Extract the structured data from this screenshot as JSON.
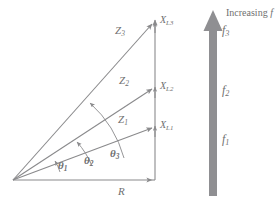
{
  "figure": {
    "colors": {
      "stroke": "#8a8a8c",
      "text": "#6f6f70",
      "arrow_fill": "#8f8f92",
      "background": "#ffffff"
    },
    "vectors": [
      {
        "name": "Z1",
        "base": "Z",
        "sub": "1",
        "label_x": 118,
        "label_y": 114,
        "angle_deg": 20
      },
      {
        "name": "Z2",
        "base": "Z",
        "sub": "2",
        "label_x": 119,
        "label_y": 75,
        "angle_deg": 37
      },
      {
        "name": "Z3",
        "base": "Z",
        "sub": "3",
        "label_x": 115,
        "label_y": 25,
        "angle_deg": 52
      }
    ],
    "reactance_labels": [
      {
        "base": "X",
        "sub": "L1",
        "x": 160,
        "y": 120
      },
      {
        "base": "X",
        "sub": "L2",
        "x": 160,
        "y": 81
      },
      {
        "base": "X",
        "sub": "L3",
        "x": 160,
        "y": 15
      }
    ],
    "angle_labels": [
      {
        "symbol": "θ",
        "sub": "1",
        "x": 58,
        "y": 160
      },
      {
        "symbol": "θ",
        "sub": "2",
        "x": 84,
        "y": 155
      },
      {
        "symbol": "θ",
        "sub": "3",
        "x": 110,
        "y": 148
      }
    ],
    "resistance_label": {
      "text": "R",
      "x": 118,
      "y": 186
    },
    "frequency_arrow": {
      "heading_static": "Increasing",
      "heading_italic": "f",
      "heading_x": 226,
      "heading_y": 8,
      "labels": [
        {
          "base": "f",
          "sub": "1",
          "x": 222,
          "y": 133
        },
        {
          "base": "f",
          "sub": "2",
          "x": 222,
          "y": 84
        },
        {
          "base": "f",
          "sub": "3",
          "x": 222,
          "y": 24
        }
      ]
    },
    "axes": {
      "vertical_x": 155,
      "origin_x": 13,
      "origin_y": 180,
      "top_y": 22
    }
  }
}
